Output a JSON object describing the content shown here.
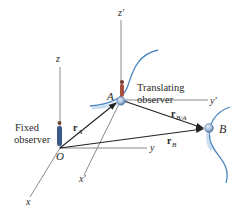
{
  "diagram": {
    "fixed_frame": {
      "origin_label": "O",
      "axes": {
        "x": "x",
        "y": "y",
        "z": "z"
      },
      "observer_label_line1": "Fixed",
      "observer_label_line2": "observer"
    },
    "translating_frame": {
      "origin_label": "A",
      "axes": {
        "x": "x'",
        "y": "y'",
        "z": "z'"
      },
      "observer_label_line1": "Translating",
      "observer_label_line2": "observer"
    },
    "points": {
      "A": "A",
      "B": "B"
    },
    "vectors": {
      "rA": {
        "main": "r",
        "sub": "A"
      },
      "rB": {
        "main": "r",
        "sub": "B"
      },
      "rBA": {
        "main": "r",
        "sub": "B/A"
      }
    },
    "colors": {
      "axis": "#8a8a8a",
      "vector": "#222222",
      "path": "#4a86c0",
      "particle": "#9fb8d6",
      "observer": "#3b5a8a"
    }
  }
}
